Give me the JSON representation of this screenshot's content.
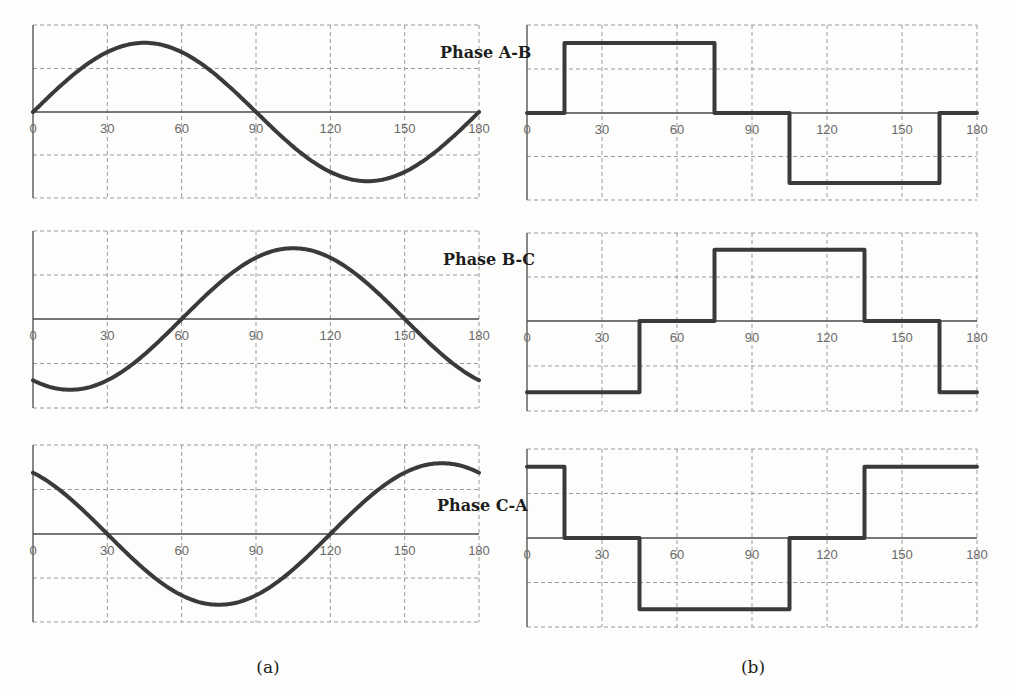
{
  "figure": {
    "captions": {
      "a": "(a)",
      "b": "(b)"
    },
    "phase_labels": [
      "Phase A-B",
      "Phase B-C",
      "Phase C-A"
    ],
    "x_ticks": [
      0,
      30,
      60,
      90,
      120,
      150,
      180
    ],
    "colors": {
      "curve": "#3a3a3a",
      "grid": "#9a9a9a",
      "axis": "#4a4a4a",
      "background": "#fdfdfb"
    }
  },
  "chart_data": [
    {
      "type": "line",
      "title": "Phase A-B (sinusoidal)",
      "panel": "a",
      "xlabel": "",
      "ylabel": "",
      "xlim": [
        0,
        180
      ],
      "ylim": [
        -1,
        1
      ],
      "x_ticks": [
        0,
        30,
        60,
        90,
        120,
        150,
        180
      ],
      "grid": true,
      "function": "0.8*sin(2x)",
      "x": [
        0,
        15,
        30,
        45,
        60,
        75,
        90,
        105,
        120,
        135,
        150,
        165,
        180
      ],
      "values": [
        0,
        0.4,
        0.69,
        0.8,
        0.69,
        0.4,
        0,
        -0.4,
        -0.69,
        -0.8,
        -0.69,
        -0.4,
        0
      ]
    },
    {
      "type": "line",
      "title": "Phase B-C (sinusoidal)",
      "panel": "a",
      "xlim": [
        0,
        180
      ],
      "ylim": [
        -1,
        1
      ],
      "x_ticks": [
        0,
        30,
        60,
        90,
        120,
        150,
        180
      ],
      "grid": true,
      "function": "0.8*sin(2x-120)",
      "x": [
        0,
        15,
        30,
        45,
        60,
        75,
        90,
        105,
        120,
        135,
        150,
        165,
        180
      ],
      "values": [
        -0.69,
        -0.8,
        -0.69,
        -0.4,
        0,
        0.4,
        0.69,
        0.8,
        0.69,
        0.4,
        0,
        -0.4,
        -0.69
      ]
    },
    {
      "type": "line",
      "title": "Phase C-A (sinusoidal)",
      "panel": "a",
      "xlim": [
        0,
        180
      ],
      "ylim": [
        -1,
        1
      ],
      "x_ticks": [
        0,
        30,
        60,
        90,
        120,
        150,
        180
      ],
      "grid": true,
      "function": "0.8*sin(2x+120)",
      "x": [
        0,
        15,
        30,
        45,
        60,
        75,
        90,
        105,
        120,
        135,
        150,
        165,
        180
      ],
      "values": [
        0.69,
        0.4,
        0,
        -0.4,
        -0.69,
        -0.8,
        -0.69,
        -0.4,
        0,
        0.4,
        0.69,
        0.8,
        0.69
      ]
    },
    {
      "type": "line",
      "title": "Phase A-B (six-step)",
      "panel": "b",
      "xlim": [
        0,
        180
      ],
      "ylim": [
        -1,
        1
      ],
      "x_ticks": [
        0,
        30,
        60,
        90,
        120,
        150,
        180
      ],
      "grid": true,
      "step": true,
      "x": [
        0,
        15,
        15,
        75,
        75,
        105,
        105,
        165,
        165,
        180
      ],
      "values": [
        0,
        0,
        0.8,
        0.8,
        0,
        0,
        -0.8,
        -0.8,
        0,
        0
      ]
    },
    {
      "type": "line",
      "title": "Phase B-C (six-step)",
      "panel": "b",
      "xlim": [
        0,
        180
      ],
      "ylim": [
        -1,
        1
      ],
      "x_ticks": [
        0,
        30,
        60,
        90,
        120,
        150,
        180
      ],
      "grid": true,
      "step": true,
      "x": [
        0,
        45,
        45,
        75,
        75,
        135,
        135,
        165,
        165,
        180
      ],
      "values": [
        -0.8,
        -0.8,
        0,
        0,
        0.8,
        0.8,
        0,
        0,
        -0.8,
        -0.8
      ]
    },
    {
      "type": "line",
      "title": "Phase C-A (six-step)",
      "panel": "b",
      "xlim": [
        0,
        180
      ],
      "ylim": [
        -1,
        1
      ],
      "x_ticks": [
        0,
        30,
        60,
        90,
        120,
        150,
        180
      ],
      "grid": true,
      "step": true,
      "x": [
        0,
        15,
        15,
        45,
        45,
        105,
        105,
        135,
        135,
        180
      ],
      "values": [
        0.8,
        0.8,
        0,
        0,
        -0.8,
        -0.8,
        0,
        0,
        0.8,
        0.8
      ]
    }
  ],
  "layout": {
    "panels": [
      {
        "x0": 33,
        "x1": 479,
        "top": 25,
        "zero": 112,
        "bottom": 198
      },
      {
        "x0": 33,
        "x1": 479,
        "top": 231,
        "zero": 319,
        "bottom": 408
      },
      {
        "x0": 33,
        "x1": 479,
        "top": 445,
        "zero": 534,
        "bottom": 622
      },
      {
        "x0": 527,
        "x1": 977,
        "top": 25,
        "zero": 113,
        "bottom": 200
      },
      {
        "x0": 527,
        "x1": 977,
        "top": 233,
        "zero": 321,
        "bottom": 411
      },
      {
        "x0": 527,
        "x1": 977,
        "top": 449,
        "zero": 538,
        "bottom": 627
      }
    ],
    "phase_label_pos": [
      {
        "x": 440,
        "y": 58
      },
      {
        "x": 443,
        "y": 265
      },
      {
        "x": 437,
        "y": 511
      }
    ],
    "caption_pos": {
      "a": {
        "x": 268,
        "y": 673
      },
      "b": {
        "x": 753,
        "y": 673
      }
    }
  }
}
